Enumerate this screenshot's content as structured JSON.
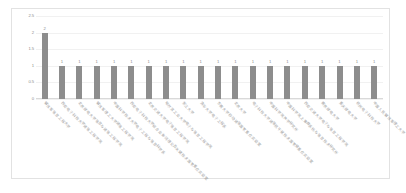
{
  "chart_data": {
    "type": "bar",
    "title": "",
    "xlabel": "",
    "ylabel": "",
    "ylim": [
      0,
      2.5
    ],
    "ytick_labels": [
      "2.5",
      "2",
      "1.5",
      "1",
      "0.5",
      "0"
    ],
    "yticks": [
      2.5,
      2,
      1.5,
      1,
      0.5,
      0
    ],
    "grid": true,
    "legend": "none",
    "data_labels": true,
    "bar_color": "#8d8d8d",
    "categories": [
      "解放军信息工程大学",
      "西安电子科技大学通信工程学院",
      "北京邮电大学信息与通信工程学院",
      "解放军理工大学通信工程学院",
      "中国科学技术大学电子工程与信息科学系",
      "西安电子科技大学综合业务网理论及关键技术国家重点实验室",
      "北京交通大学电子信息工程学院",
      "哈尔滨工业大学电子与信息工程学院",
      "浙江大学",
      "清华大学电子工程系",
      "东南大学移动通信国家重点实验室",
      "北京大学",
      "电子科技大学通信抗干扰技术国家级重点实验室",
      "中国科学院声学研究所",
      "中国科学院上海微系统与信息技术研究所",
      "西安交通大学电子与信息工程学院",
      "南京邮电大学",
      "重庆邮电大学",
      "杭州电子科技大学",
      "中国人民解放军理工大学"
    ],
    "values": [
      2,
      1,
      1,
      1,
      1,
      1,
      1,
      1,
      1,
      1,
      1,
      1,
      1,
      1,
      1,
      1,
      1,
      1,
      1,
      1
    ],
    "value_labels": [
      "2",
      "1",
      "1",
      "1",
      "1",
      "1",
      "1",
      "1",
      "1",
      "1",
      "1",
      "1",
      "1",
      "1",
      "1",
      "1",
      "1",
      "1",
      "1",
      "1"
    ]
  }
}
